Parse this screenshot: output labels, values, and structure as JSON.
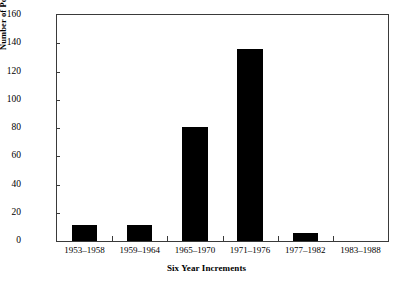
{
  "chart_data": {
    "type": "bar",
    "title": "",
    "subtitle": "",
    "xlabel": "Six Year Increments",
    "ylabel": "Number of Power Plants Ordered",
    "categories": [
      "1953–1958",
      "1959–1964",
      "1965–1970",
      "1971–1976",
      "1977–1982",
      "1983–1988"
    ],
    "values": [
      11,
      11,
      81,
      136,
      6,
      0
    ],
    "ylim": [
      0,
      160
    ],
    "ytick_values": [
      0,
      20,
      40,
      60,
      80,
      100,
      120,
      140,
      160
    ],
    "ytick_labels": [
      "0",
      "20",
      "40",
      "60",
      "80",
      "100",
      "120",
      "140",
      "160"
    ],
    "grid": false,
    "legend": null,
    "legend_position": "none",
    "bar_color": "#000000",
    "frame_color": "#3a3a3a",
    "background_color": "#ffffff",
    "annotations": []
  }
}
